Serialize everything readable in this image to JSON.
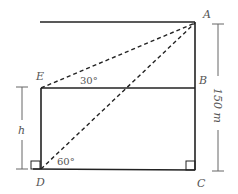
{
  "diagram": {
    "type": "geometry-heights-and-distances",
    "points": {
      "A": {
        "label": "A"
      },
      "B": {
        "label": "B"
      },
      "C": {
        "label": "C"
      },
      "D": {
        "label": "D"
      },
      "E": {
        "label": "E"
      }
    },
    "angles": {
      "depression_at_E": "30°",
      "elevation_at_D": "60°"
    },
    "dimensions": {
      "tower_height": "150 m",
      "building_height": "h"
    },
    "colors": {
      "line": "#222222",
      "label": "#555555",
      "dimension": "#666666"
    }
  }
}
